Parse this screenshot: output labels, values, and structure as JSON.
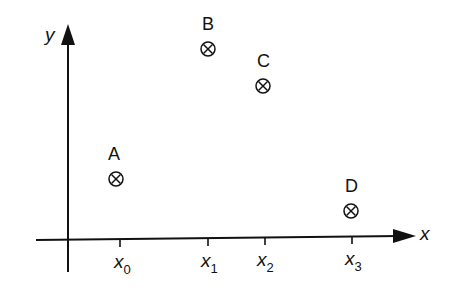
{
  "diagram": {
    "type": "coordinate-plot-with-labeled-points",
    "colors": {
      "ink": "#111111",
      "background": "#ffffff"
    },
    "axes": {
      "x": {
        "label": "x",
        "ticks": [
          {
            "base": "x",
            "sub": "0"
          },
          {
            "base": "x",
            "sub": "1"
          },
          {
            "base": "x",
            "sub": "2"
          },
          {
            "base": "x",
            "sub": "3"
          }
        ]
      },
      "y": {
        "label": "y"
      }
    },
    "points": [
      {
        "label": "A",
        "x_tick": "x0",
        "marker": "circled-x"
      },
      {
        "label": "B",
        "x_tick": "x1",
        "marker": "circled-x"
      },
      {
        "label": "C",
        "x_tick": "x2",
        "marker": "circled-x"
      },
      {
        "label": "D",
        "x_tick": "x3",
        "marker": "circled-x"
      }
    ]
  }
}
